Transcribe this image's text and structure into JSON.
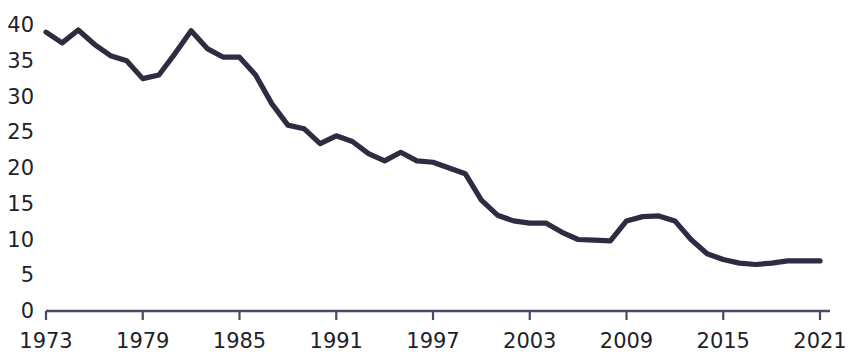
{
  "chart_data": {
    "type": "line",
    "title": "",
    "subtitle": "",
    "xlabel": "",
    "ylabel": "",
    "xlim": [
      1973,
      2021
    ],
    "ylim": [
      0,
      40
    ],
    "grid": false,
    "legend": "none",
    "line_color": "#2f2c41",
    "axis_color": "#4a4a66",
    "text_color": "#231f2a",
    "y_ticks": [
      "0",
      "5",
      "10",
      "15",
      "20",
      "25",
      "30",
      "35",
      "40"
    ],
    "y_tick_values": [
      0,
      5,
      10,
      15,
      20,
      25,
      30,
      35,
      40
    ],
    "x_ticks": [
      "1973",
      "1979",
      "1985",
      "1991",
      "1997",
      "2003",
      "2009",
      "2015",
      "2021"
    ],
    "x_tick_values": [
      1973,
      1979,
      1985,
      1991,
      1997,
      2003,
      2009,
      2015,
      2021
    ],
    "x": [
      1973,
      1974,
      1975,
      1976,
      1977,
      1978,
      1979,
      1980,
      1981,
      1982,
      1983,
      1984,
      1985,
      1986,
      1987,
      1988,
      1989,
      1990,
      1991,
      1992,
      1993,
      1994,
      1995,
      1996,
      1997,
      1998,
      1999,
      2000,
      2001,
      2002,
      2003,
      2004,
      2005,
      2006,
      2007,
      2008,
      2009,
      2010,
      2011,
      2012,
      2013,
      2014,
      2015,
      2016,
      2017,
      2018,
      2019,
      2020,
      2021
    ],
    "series": [
      {
        "name": "value",
        "values": [
          39.0,
          37.5,
          39.3,
          37.3,
          35.7,
          35.0,
          32.5,
          33.0,
          36.0,
          39.2,
          36.7,
          35.5,
          35.5,
          33.0,
          29.0,
          26.0,
          25.5,
          23.4,
          24.5,
          23.7,
          22.0,
          21.0,
          22.2,
          21.0,
          20.8,
          20.0,
          19.2,
          15.5,
          13.4,
          12.6,
          12.3,
          12.3,
          11.0,
          10.0,
          9.9,
          9.8,
          12.6,
          13.2,
          13.3,
          12.6,
          10.0,
          8.0,
          7.2,
          6.7,
          6.5,
          6.7,
          7.0,
          7.0,
          7.0
        ]
      }
    ]
  }
}
